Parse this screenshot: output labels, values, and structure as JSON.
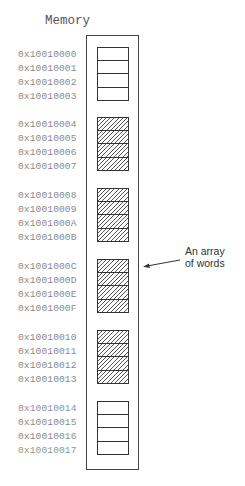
{
  "title": "Memory",
  "annotation": {
    "line1": "An array",
    "line2": "of words"
  },
  "groups": [
    {
      "hatched": false,
      "addresses": [
        "0x10010000",
        "0x10010001",
        "0x10010002",
        "0x10010003"
      ]
    },
    {
      "hatched": true,
      "addresses": [
        "0x10010004",
        "0x10010005",
        "0x10010006",
        "0x10010007"
      ]
    },
    {
      "hatched": true,
      "addresses": [
        "0x10010008",
        "0x10010009",
        "0x1001000A",
        "0x1001000B"
      ]
    },
    {
      "hatched": true,
      "addresses": [
        "0x1001000C",
        "0x1001000D",
        "0x1001000E",
        "0x1001000F"
      ]
    },
    {
      "hatched": true,
      "addresses": [
        "0x10010010",
        "0x10010011",
        "0x10010012",
        "0x10010013"
      ]
    },
    {
      "hatched": false,
      "addresses": [
        "0x10010014",
        "0x10010015",
        "0x10010016",
        "0x10010017"
      ]
    }
  ]
}
